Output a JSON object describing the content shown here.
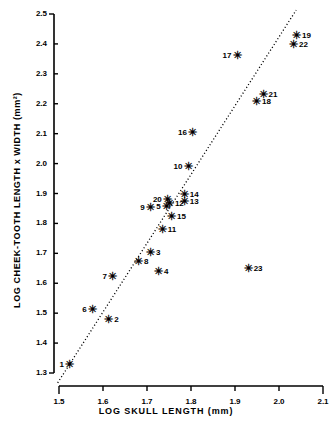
{
  "chart_data": {
    "type": "scatter",
    "title": "",
    "xlabel": "LOG  SKULL  LENGTH   (mm)",
    "ylabel": "LOG  CHEEK-TOOTH  LENGTH  x  WIDTH   (mm²)",
    "xlim": [
      1.5,
      2.1
    ],
    "ylim": [
      1.3,
      2.5
    ],
    "xticks": [
      "1.5",
      "1.6",
      "1.7",
      "1.8",
      "1.9",
      "2.0",
      "2.1"
    ],
    "yticks": [
      "1.3",
      "1.4",
      "1.5",
      "1.6",
      "1.7",
      "1.8",
      "1.9",
      "2.0",
      "2.1",
      "2.2",
      "2.3",
      "2.4",
      "2.5"
    ],
    "grid": false,
    "legend": "none",
    "marker_symbol": "✳",
    "trendline": {
      "style": "dotted",
      "x_start": 1.497,
      "y_start": 1.267,
      "x_end": 2.039,
      "y_end": 2.513
    },
    "points": [
      {
        "label": "1",
        "x": 1.525,
        "y": 1.327,
        "label_side": "left"
      },
      {
        "label": "2",
        "x": 1.614,
        "y": 1.478,
        "label_side": "right"
      },
      {
        "label": "3",
        "x": 1.709,
        "y": 1.702,
        "label_side": "right"
      },
      {
        "label": "4",
        "x": 1.727,
        "y": 1.639,
        "label_side": "right"
      },
      {
        "label": "5",
        "x": 1.745,
        "y": 1.855,
        "label_side": "left"
      },
      {
        "label": "6",
        "x": 1.577,
        "y": 1.512,
        "label_side": "left"
      },
      {
        "label": "7",
        "x": 1.623,
        "y": 1.622,
        "label_side": "left"
      },
      {
        "label": "8",
        "x": 1.682,
        "y": 1.672,
        "label_side": "right"
      },
      {
        "label": "9",
        "x": 1.709,
        "y": 1.853,
        "label_side": "left"
      },
      {
        "label": "10",
        "x": 1.795,
        "y": 1.989,
        "label_side": "left"
      },
      {
        "label": "11",
        "x": 1.736,
        "y": 1.779,
        "label_side": "right"
      },
      {
        "label": "12",
        "x": 1.752,
        "y": 1.866,
        "label_side": "right"
      },
      {
        "label": "13",
        "x": 1.786,
        "y": 1.872,
        "label_side": "right"
      },
      {
        "label": "14",
        "x": 1.786,
        "y": 1.894,
        "label_side": "right"
      },
      {
        "label": "15",
        "x": 1.757,
        "y": 1.822,
        "label_side": "right"
      },
      {
        "label": "16",
        "x": 1.805,
        "y": 2.103,
        "label_side": "left"
      },
      {
        "label": "17",
        "x": 1.906,
        "y": 2.358,
        "label_side": "left"
      },
      {
        "label": "18",
        "x": 1.95,
        "y": 2.205,
        "label_side": "right"
      },
      {
        "label": "19",
        "x": 2.041,
        "y": 2.428,
        "label_side": "right"
      },
      {
        "label": "20",
        "x": 1.748,
        "y": 1.877,
        "label_side": "left"
      },
      {
        "label": "21",
        "x": 1.965,
        "y": 2.229,
        "label_side": "right"
      },
      {
        "label": "22",
        "x": 2.034,
        "y": 2.396,
        "label_side": "right"
      },
      {
        "label": "23",
        "x": 1.931,
        "y": 1.647,
        "label_side": "right"
      }
    ]
  }
}
